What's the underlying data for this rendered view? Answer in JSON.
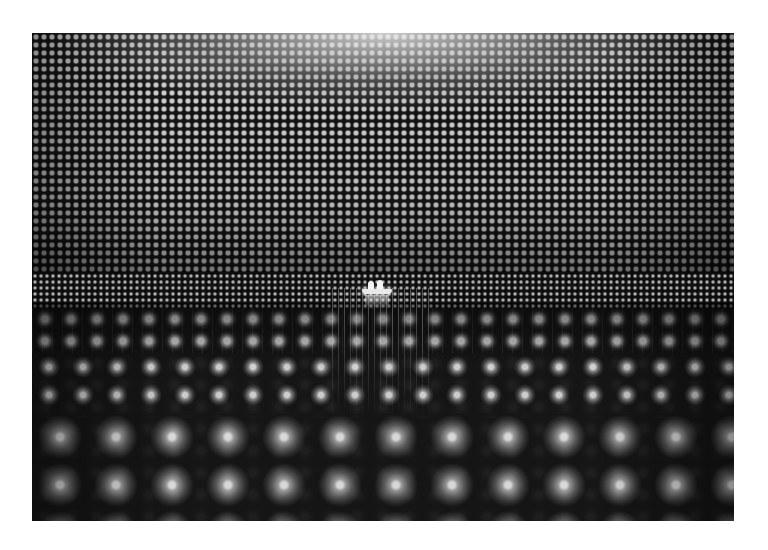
{
  "image": {
    "description": "Grayscale photograph of the interior of a large cylindrical detector tank lined with a dense grid of photomultiplier tubes, with a small inflatable boat carrying two people floating at the center",
    "palette": {
      "background": "#ffffff",
      "dark": "#111111",
      "highlight": "#e9e9e9"
    },
    "frame": {
      "left": 32,
      "top": 33,
      "width": 702,
      "height": 488
    },
    "elements": [
      "pmt-wall-grid",
      "pmt-floor-grid",
      "boat-with-two-people"
    ]
  }
}
